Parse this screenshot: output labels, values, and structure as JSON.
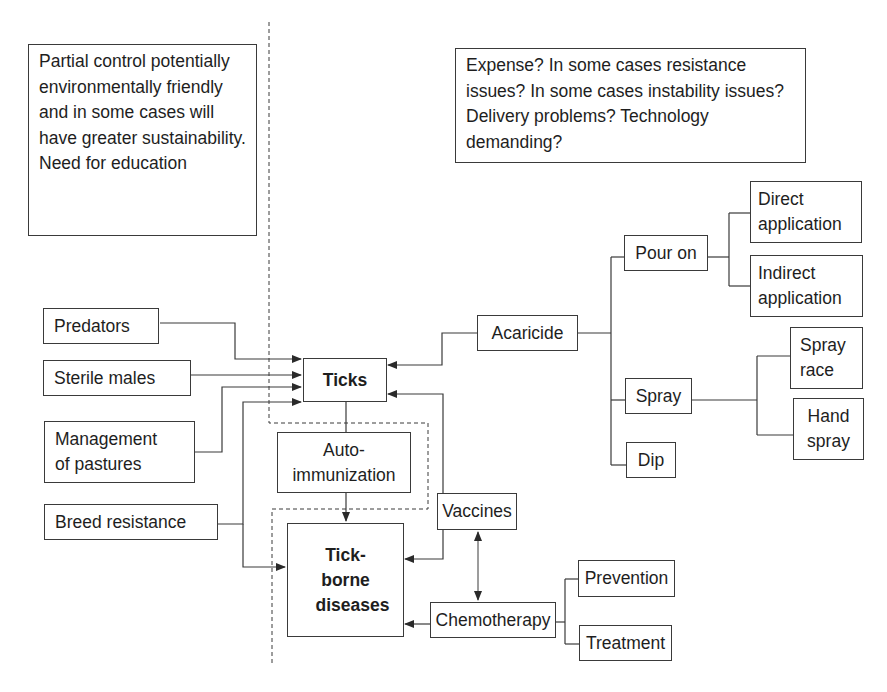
{
  "notes": {
    "left": "Partial control potentially environmentally friendly and in some cases will have greater sustainability. Need for education",
    "right": "Expense? In some cases resistance issues? In some cases instability issues? Delivery problems? Technology demanding?"
  },
  "nodes": {
    "predators": "Predators",
    "sterile_males": "Sterile males",
    "management_of_pastures": "Management of pastures",
    "breed_resistance": "Breed resistance",
    "ticks": "Ticks",
    "auto_immunization": "Auto-immunization",
    "tick_borne_diseases": "Tick-borne diseases",
    "acaricide": "Acaricide",
    "pour_on": "Pour on",
    "spray": "Spray",
    "dip": "Dip",
    "direct_application": "Direct application",
    "indirect_application": "Indirect application",
    "spray_race": "Spray race",
    "hand_spray": "Hand spray",
    "vaccines": "Vaccines",
    "chemotherapy": "Chemotherapy",
    "prevention": "Prevention",
    "treatment": "Treatment"
  },
  "edges": [
    {
      "from": "Predators",
      "to": "Ticks"
    },
    {
      "from": "Sterile males",
      "to": "Ticks"
    },
    {
      "from": "Management of pastures",
      "to": "Ticks"
    },
    {
      "from": "Breed resistance",
      "to": "Ticks"
    },
    {
      "from": "Breed resistance",
      "to": "Tick-borne diseases"
    },
    {
      "from": "Ticks",
      "to": "Tick-borne diseases",
      "via": "Auto-immunization"
    },
    {
      "from": "Acaricide",
      "to": "Ticks"
    },
    {
      "from": "Vaccines",
      "to": "Ticks"
    },
    {
      "from": "Vaccines",
      "to": "Tick-borne diseases"
    },
    {
      "from": "Chemotherapy",
      "to": "Tick-borne diseases"
    },
    {
      "from": "Vaccines",
      "to": "Chemotherapy",
      "bidirectional": true
    },
    {
      "from": "Acaricide",
      "to": "Pour on"
    },
    {
      "from": "Acaricide",
      "to": "Spray"
    },
    {
      "from": "Acaricide",
      "to": "Dip"
    },
    {
      "from": "Pour on",
      "to": "Direct application"
    },
    {
      "from": "Pour on",
      "to": "Indirect application"
    },
    {
      "from": "Spray",
      "to": "Spray race"
    },
    {
      "from": "Spray",
      "to": "Hand spray"
    },
    {
      "from": "Chemotherapy",
      "to": "Prevention"
    },
    {
      "from": "Chemotherapy",
      "to": "Treatment"
    }
  ],
  "colors": {
    "line": "#3a3a3a",
    "text": "#1e1e1e",
    "background": "#ffffff"
  }
}
